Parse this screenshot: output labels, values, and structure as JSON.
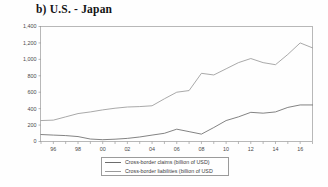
{
  "figure": {
    "title": "b) U.S. - Japan",
    "background_color": "#fefefe"
  },
  "legend": {
    "entries": [
      {
        "label": "Cross-border claims (billion of USD)",
        "color": "#6d6d6d",
        "swatch": "line-swatch-claims"
      },
      {
        "label": "Cross-border liabilities (billion of USD",
        "color": "#9a9a9a",
        "swatch": "line-swatch-liabilities"
      }
    ]
  },
  "chart_data": {
    "type": "line",
    "title": "b) U.S. - Japan",
    "xlabel": "",
    "ylabel": "",
    "ylim": [
      0,
      1400
    ],
    "xlim": [
      1995,
      2017
    ],
    "grid": false,
    "legend_position": "bottom-center",
    "ytick_labels": [
      "0",
      "200",
      "400",
      "600",
      "800",
      "1,000",
      "1,200",
      "1,400"
    ],
    "ytick_values": [
      0,
      200,
      400,
      600,
      800,
      1000,
      1200,
      1400
    ],
    "xtick_labels": [
      "96",
      "98",
      "00",
      "02",
      "04",
      "06",
      "08",
      "10",
      "12",
      "14",
      "16"
    ],
    "xtick_values": [
      1996,
      1998,
      2000,
      2002,
      2004,
      2006,
      2008,
      2010,
      2012,
      2014,
      2016
    ],
    "x": [
      1995,
      1996,
      1997,
      1998,
      1999,
      2000,
      2001,
      2002,
      2003,
      2004,
      2005,
      2006,
      2007,
      2008,
      2009,
      2010,
      2011,
      2012,
      2013,
      2014,
      2015,
      2016,
      2017
    ],
    "series": [
      {
        "name": "Cross-border claims (billion of USD)",
        "color": "#6d6d6d",
        "values": [
          85,
          78,
          72,
          60,
          30,
          22,
          28,
          38,
          55,
          78,
          100,
          150,
          120,
          90,
          170,
          255,
          300,
          355,
          345,
          360,
          415,
          445,
          445
        ]
      },
      {
        "name": "Cross-border liabilities (billion of USD",
        "color": "#9a9a9a",
        "values": [
          255,
          260,
          300,
          340,
          360,
          385,
          405,
          420,
          425,
          435,
          520,
          600,
          620,
          830,
          810,
          885,
          960,
          1010,
          960,
          935,
          1060,
          1200,
          1140
        ]
      }
    ]
  }
}
